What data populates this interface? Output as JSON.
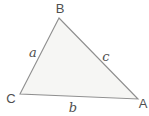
{
  "diagram": {
    "type": "triangle",
    "vertices": [
      {
        "id": "B",
        "label": "B",
        "position": "top"
      },
      {
        "id": "C",
        "label": "C",
        "position": "bottom-left"
      },
      {
        "id": "A",
        "label": "A",
        "position": "bottom-right"
      }
    ],
    "sides": [
      {
        "id": "a",
        "label": "a",
        "between": "B-C"
      },
      {
        "id": "b",
        "label": "b",
        "between": "C-A"
      },
      {
        "id": "c",
        "label": "c",
        "between": "B-A"
      }
    ],
    "colors": {
      "fill": "#f6f6f4",
      "stroke": "#8f8f8f",
      "text": "#4f4f4f",
      "background": "#ffffff"
    }
  }
}
